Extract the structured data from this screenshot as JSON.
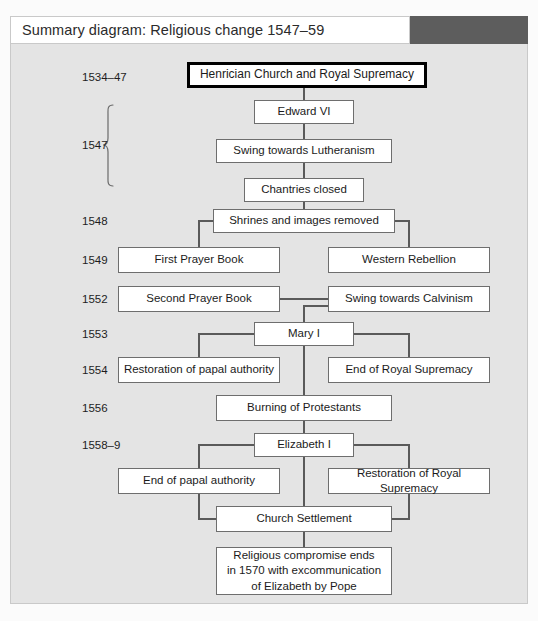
{
  "header": {
    "title": "Summary diagram: Religious change 1547–59",
    "accent_block_color": "#5d5d5d",
    "bar_color": "#ffffff"
  },
  "colors": {
    "panel_background": "#e4e4e4",
    "page_background": "#fbfbfb",
    "box_fill": "#ffffff",
    "box_border": "#6e6e6e",
    "emphasis_border": "#000000",
    "connector": "#5a5a5a",
    "text": "#1b1b1b"
  },
  "diagram": {
    "type": "flowchart",
    "orientation": "top-to-bottom",
    "years": [
      {
        "id": "y1534",
        "label": "1534–47",
        "x": 72,
        "y": 28
      },
      {
        "id": "y1547",
        "label": "1547",
        "x": 72,
        "y": 104,
        "brace": true
      },
      {
        "id": "y1548",
        "label": "1548",
        "x": 72,
        "y": 172
      },
      {
        "id": "y1549",
        "label": "1549",
        "x": 72,
        "y": 210
      },
      {
        "id": "y1552",
        "label": "1552",
        "x": 72,
        "y": 249
      },
      {
        "id": "y1553",
        "label": "1553",
        "x": 72,
        "y": 284
      },
      {
        "id": "y1554",
        "label": "1554",
        "x": 72,
        "y": 320
      },
      {
        "id": "y1556",
        "label": "1556",
        "x": 72,
        "y": 358
      },
      {
        "id": "y1558",
        "label": "1558–9",
        "x": 72,
        "y": 395
      }
    ],
    "nodes": [
      {
        "id": "henrician",
        "label": "Henrician Church and Royal Supremacy",
        "emphasis": true,
        "x": 177,
        "y": 18,
        "w": 240,
        "h": 26
      },
      {
        "id": "edward",
        "label": "Edward VI",
        "x": 244,
        "y": 56,
        "w": 100,
        "h": 24
      },
      {
        "id": "lutheranism",
        "label": "Swing towards Lutheranism",
        "x": 206,
        "y": 95,
        "w": 176,
        "h": 24
      },
      {
        "id": "chantries",
        "label": "Chantries closed",
        "x": 234,
        "y": 134,
        "w": 120,
        "h": 24
      },
      {
        "id": "shrines",
        "label": "Shrines and images removed",
        "x": 203,
        "y": 165,
        "w": 182,
        "h": 24
      },
      {
        "id": "first-prayer",
        "label": "First Prayer Book",
        "x": 108,
        "y": 203,
        "w": 162,
        "h": 26
      },
      {
        "id": "western-rebellion",
        "label": "Western Rebellion",
        "x": 318,
        "y": 203,
        "w": 162,
        "h": 26
      },
      {
        "id": "second-prayer",
        "label": "Second Prayer Book",
        "x": 108,
        "y": 242,
        "w": 162,
        "h": 26
      },
      {
        "id": "calvinism",
        "label": "Swing towards Calvinism",
        "x": 318,
        "y": 242,
        "w": 162,
        "h": 26
      },
      {
        "id": "mary",
        "label": "Mary I",
        "x": 244,
        "y": 278,
        "w": 100,
        "h": 24
      },
      {
        "id": "papal-restoration",
        "label": "Restoration of papal authority",
        "x": 108,
        "y": 313,
        "w": 162,
        "h": 26
      },
      {
        "id": "end-royal-supremacy",
        "label": "End of Royal Supremacy",
        "x": 318,
        "y": 313,
        "w": 162,
        "h": 26
      },
      {
        "id": "burning",
        "label": "Burning of Protestants",
        "x": 206,
        "y": 351,
        "w": 176,
        "h": 26
      },
      {
        "id": "elizabeth",
        "label": "Elizabeth I",
        "x": 244,
        "y": 389,
        "w": 100,
        "h": 24
      },
      {
        "id": "end-papal",
        "label": "End of papal authority",
        "x": 108,
        "y": 424,
        "w": 162,
        "h": 26
      },
      {
        "id": "royal-supremacy-restored",
        "label": "Restoration of Royal Supremacy",
        "x": 318,
        "y": 424,
        "w": 162,
        "h": 26
      },
      {
        "id": "church-settlement",
        "label": "Church Settlement",
        "x": 206,
        "y": 462,
        "w": 176,
        "h": 26
      },
      {
        "id": "compromise",
        "label": "Religious compromise ends\nin 1570 with excommunication\nof Elizabeth by Pope",
        "x": 206,
        "y": 503,
        "w": 176,
        "h": 48
      }
    ],
    "edges": [
      {
        "from": "henrician",
        "to": "edward",
        "style": "vertical"
      },
      {
        "from": "edward",
        "to": "lutheranism",
        "style": "vertical"
      },
      {
        "from": "lutheranism",
        "to": "chantries",
        "style": "vertical"
      },
      {
        "from": "chantries",
        "to": "shrines",
        "style": "vertical"
      },
      {
        "from": "shrines",
        "to": "first-prayer",
        "style": "elbow-left"
      },
      {
        "from": "shrines",
        "to": "western-rebellion",
        "style": "elbow-right"
      },
      {
        "from": "second-prayer",
        "to": "calvinism",
        "style": "horizontal"
      },
      {
        "from": "calvinism",
        "to": "mary",
        "style": "vertical"
      },
      {
        "from": "mary",
        "to": "papal-restoration",
        "style": "elbow-left"
      },
      {
        "from": "mary",
        "to": "end-royal-supremacy",
        "style": "elbow-right"
      },
      {
        "from": "mary",
        "to": "burning",
        "style": "vertical"
      },
      {
        "from": "burning",
        "to": "elizabeth",
        "style": "vertical"
      },
      {
        "from": "elizabeth",
        "to": "end-papal",
        "style": "elbow-left"
      },
      {
        "from": "elizabeth",
        "to": "royal-supremacy-restored",
        "style": "elbow-right"
      },
      {
        "from": "elizabeth",
        "to": "church-settlement",
        "style": "vertical"
      },
      {
        "from": "end-papal",
        "to": "church-settlement",
        "style": "elbow-left-in"
      },
      {
        "from": "royal-supremacy-restored",
        "to": "church-settlement",
        "style": "elbow-right-in"
      }
    ]
  }
}
